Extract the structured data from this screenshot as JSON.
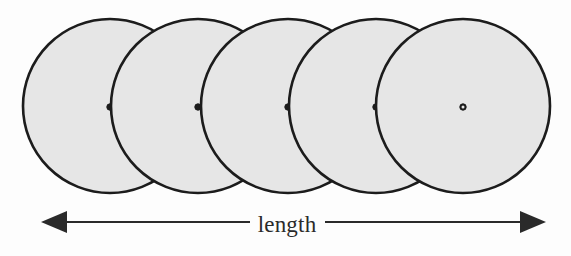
{
  "figure": {
    "kind": "technical-diagram",
    "background_color": "#fdfdfd",
    "circle": {
      "count": 5,
      "radius": 87,
      "fill_color": "#e6e6e6",
      "stroke_color": "#1c1c1c",
      "stroke_width": 2.6,
      "center_y": 106,
      "center_x_values": [
        110,
        198,
        288,
        376,
        463
      ],
      "spacing": 88,
      "center_dot": {
        "outer_radius": 3.2,
        "inner_radius": 1.5,
        "stroke_color": "#1c1c1c",
        "fill_color": "#1c1c1c"
      }
    },
    "dimension": {
      "label": "length",
      "label_center_x": 287,
      "label_baseline_y": 231,
      "line_y": 222,
      "left_tip_x": 41,
      "right_tip_x": 546,
      "left_segment_end_x": 250,
      "right_segment_start_x": 325,
      "line_color": "#2a2a2a",
      "line_width": 2.2,
      "arrow_head_length": 26,
      "arrow_head_half_width": 11
    }
  }
}
